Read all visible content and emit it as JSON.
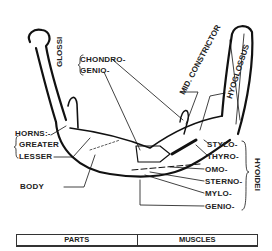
{
  "diagram": {
    "labels": {
      "glossi_group": "GLOSSI",
      "chondro": "CHONDRO-",
      "genio_glossi": "GENIO-",
      "mid_constrictor": "MID. CONSTRICTOR",
      "hyoglossus": "HYOGLOSSUS",
      "horns": "HORNS:-",
      "greater": "GREATER",
      "lesser": "LESSER",
      "body": "BODY",
      "stylo": "STYLO-",
      "thyro": "THYRO-",
      "omo": "OMO-",
      "sterno": "STERNO-",
      "mylo": "MYLO-",
      "genio_hyoidei": "GENIO-",
      "hyoidei_group": "HYOIDEI"
    }
  },
  "table": {
    "headers": [
      "PARTS",
      "MUSCLES"
    ]
  }
}
